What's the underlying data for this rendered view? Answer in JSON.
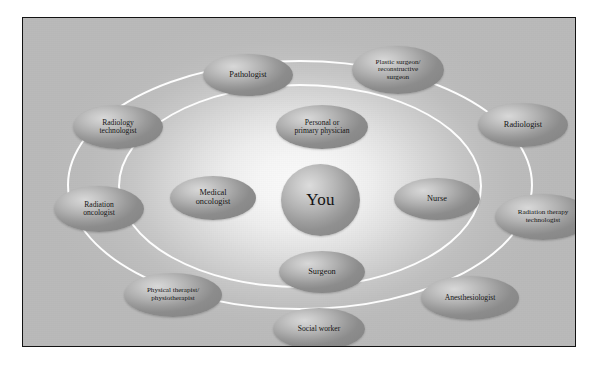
{
  "diagram": {
    "center": {
      "id": "you",
      "label": "You"
    },
    "inner_ring": [
      {
        "id": "personal-or-primary-physician",
        "label": "Personal or\nprimary physician"
      },
      {
        "id": "medical-oncologist",
        "label": "Medical\noncologist"
      },
      {
        "id": "nurse",
        "label": "Nurse"
      },
      {
        "id": "surgeon",
        "label": "Surgeon"
      }
    ],
    "outer_ring": [
      {
        "id": "pathologist",
        "label": "Pathologist"
      },
      {
        "id": "plastic-reconstructive-surgeon",
        "label": "Plastic surgeon/\nreconstructive\nsurgeon"
      },
      {
        "id": "radiology-technologist",
        "label": "Radiology\ntechnologist"
      },
      {
        "id": "radiologist",
        "label": "Radiologist"
      },
      {
        "id": "radiation-oncologist",
        "label": "Radiation\noncologist"
      },
      {
        "id": "radiation-therapy-technologist",
        "label": "Radiation therapy\ntechnologist"
      },
      {
        "id": "physical-therapist-physiotherapist",
        "label": "Physical therapist/\nphysiotherapist"
      },
      {
        "id": "anesthesiologist",
        "label": "Anesthesiologist"
      },
      {
        "id": "social-worker",
        "label": "Social worker"
      }
    ],
    "rings": [
      {
        "id": "inner-orbit",
        "color": "#fdfdfd"
      },
      {
        "id": "outer-orbit",
        "color": "#fdfdfd"
      }
    ],
    "colors": {
      "frame_border": "#131313",
      "background_edge": "#bababa",
      "background_center": "#fbfbfb",
      "node_fill_light": "#d8d8d8",
      "node_fill_dark": "#888888",
      "ring_stroke": "#fdfdfd",
      "text": "#141414"
    }
  }
}
